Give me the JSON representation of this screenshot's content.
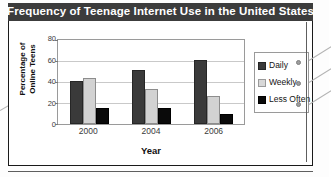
{
  "figure": {
    "title": "Frequency of Teenage Internet Use in the United States"
  },
  "chart_data": {
    "type": "bar",
    "title": "Frequency of Teenage Internet Use in the United States",
    "xlabel": "Year",
    "ylabel": "Percentage of Online Teens",
    "categories": [
      "2000",
      "2004",
      "2006"
    ],
    "series": [
      {
        "name": "Daily",
        "values": [
          41,
          51,
          61
        ],
        "color": "#3a3a3a"
      },
      {
        "name": "Weekly",
        "values": [
          44,
          33,
          27
        ],
        "color": "#d2d2d2"
      },
      {
        "name": "Less Often",
        "values": [
          15,
          15,
          10
        ],
        "color": "#0a0a0a"
      }
    ],
    "ylim": [
      0,
      80
    ],
    "yticks": [
      "0",
      "20",
      "40",
      "60",
      "80"
    ],
    "ytick_values": [
      0,
      20,
      40,
      60,
      80
    ],
    "grid": true,
    "legend_position": "right"
  },
  "legend": {
    "items": [
      {
        "label": "Daily"
      },
      {
        "label": "Weekly"
      },
      {
        "label": "Less Often"
      }
    ]
  },
  "axes": {
    "y_title_line1": "Percentage of",
    "y_title_line2": "Online Teens",
    "x_title": "Year"
  }
}
